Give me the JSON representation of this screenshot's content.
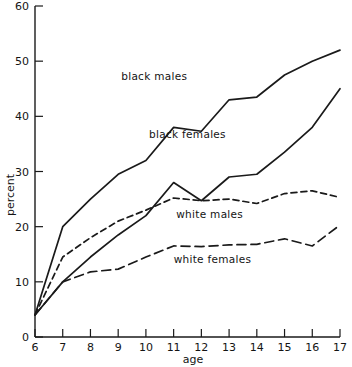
{
  "chart_data": {
    "type": "line",
    "title": "",
    "xlabel": "age",
    "ylabel": "percent",
    "x": [
      6,
      7,
      8,
      9,
      10,
      11,
      12,
      13,
      14,
      15,
      16,
      17
    ],
    "xticklabels": [
      "6",
      "7",
      "8",
      "9",
      "10",
      "11",
      "12",
      "13",
      "14",
      "15",
      "16",
      "17"
    ],
    "yticklabels": [
      "0",
      "10",
      "20",
      "30",
      "40",
      "50",
      "60"
    ],
    "yticks": [
      0,
      10,
      20,
      30,
      40,
      50,
      60
    ],
    "xlim": [
      6,
      17
    ],
    "ylim": [
      0,
      60
    ],
    "grid": false,
    "legend": "inline-annotations",
    "series": [
      {
        "name": "black males",
        "style": "solid",
        "color": "#1a1a1a",
        "values": [
          4.0,
          20.0,
          25.0,
          29.5,
          32.0,
          38.0,
          37.3,
          43.0,
          43.5,
          47.5,
          50.0,
          52.0
        ],
        "label": "black males",
        "label_x": 10.3,
        "label_y": 46.5
      },
      {
        "name": "black females",
        "style": "solid",
        "color": "#1a1a1a",
        "values": [
          4.0,
          10.0,
          14.5,
          18.5,
          22.0,
          28.0,
          24.7,
          29.0,
          29.5,
          33.5,
          38.0,
          45.0
        ],
        "label": "black females",
        "label_x": 11.5,
        "label_y": 36.0
      },
      {
        "name": "white males",
        "style": "dashed-short",
        "color": "#1a1a1a",
        "values": [
          4.0,
          14.5,
          18.0,
          21.0,
          23.0,
          25.2,
          24.7,
          25.0,
          24.2,
          26.0,
          26.5,
          25.3
        ],
        "label": "white males",
        "label_x": 12.3,
        "label_y": 21.5
      },
      {
        "name": "white females",
        "style": "dashed-long",
        "color": "#1a1a1a",
        "values": [
          4.0,
          10.0,
          11.8,
          12.3,
          14.5,
          16.5,
          16.4,
          16.7,
          16.8,
          17.8,
          16.5,
          20.3
        ],
        "label": "white females",
        "label_x": 12.4,
        "label_y": 13.5
      }
    ]
  },
  "axes": {
    "y_label": "percent",
    "x_label": "age"
  }
}
